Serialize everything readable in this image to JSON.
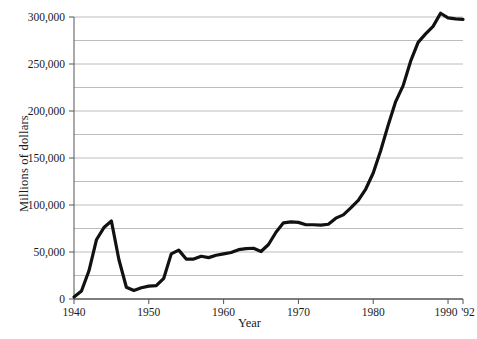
{
  "chart_data": {
    "type": "line",
    "title": "",
    "xlabel": "Year",
    "ylabel": "Millions of dollars",
    "xlim": [
      1940,
      1992
    ],
    "ylim": [
      0,
      310000
    ],
    "grid": true,
    "grid_axis": "y",
    "legend": "none",
    "y_gridline_values": [
      0,
      25000,
      50000,
      75000,
      100000,
      125000,
      150000,
      175000,
      200000,
      225000,
      250000,
      275000,
      300000
    ],
    "y_tick_labels": [
      "0",
      "50,000",
      "100,000",
      "150,000",
      "200,000",
      "250,000",
      "300,000"
    ],
    "y_tick_values": [
      0,
      50000,
      100000,
      150000,
      200000,
      250000,
      300000
    ],
    "x_tick_values": [
      1940,
      1950,
      1960,
      1970,
      1980,
      1990,
      1992
    ],
    "x_tick_labels": [
      "1940",
      "1950",
      "1960",
      "1970",
      "1980",
      "1990",
      "'92"
    ],
    "line_color": "#111111",
    "grid_color": "#b4b4b4",
    "axis_color": "#555555",
    "series": [
      {
        "name": "Federal outlays",
        "x": [
          1940,
          1941,
          1942,
          1943,
          1944,
          1945,
          1946,
          1947,
          1948,
          1949,
          1950,
          1951,
          1952,
          1953,
          1954,
          1955,
          1956,
          1957,
          1958,
          1959,
          1960,
          1961,
          1962,
          1963,
          1964,
          1965,
          1966,
          1967,
          1968,
          1969,
          1970,
          1971,
          1972,
          1973,
          1974,
          1975,
          1976,
          1977,
          1978,
          1979,
          1980,
          1981,
          1982,
          1983,
          1984,
          1985,
          1986,
          1987,
          1988,
          1989,
          1990,
          1991,
          1992
        ],
        "values": [
          2200,
          8500,
          30000,
          63000,
          76000,
          83000,
          42000,
          12500,
          9100,
          11900,
          13700,
          14200,
          22000,
          48000,
          52000,
          42500,
          42500,
          45500,
          44000,
          46500,
          48000,
          49500,
          52500,
          53500,
          54000,
          50500,
          58000,
          71000,
          81000,
          82000,
          81500,
          79000,
          79000,
          78500,
          79500,
          86000,
          89500,
          97000,
          105000,
          117000,
          134000,
          158000,
          185000,
          210000,
          227000,
          253000,
          273000,
          282000,
          290000,
          304000,
          299000,
          298000,
          297500
        ]
      }
    ]
  },
  "labels": {
    "x_axis_title": "Year",
    "y_axis_title": "Millions of dollars"
  }
}
